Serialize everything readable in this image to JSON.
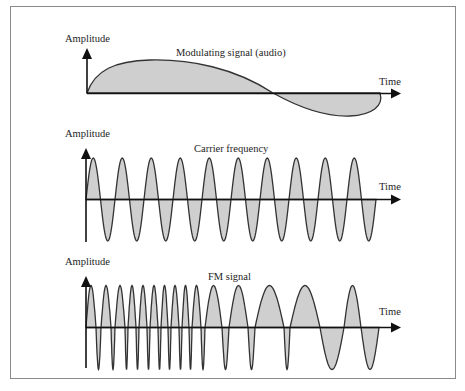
{
  "colors": {
    "frame_border": "#8a8a8a",
    "wave_fill": "#cfcfcf",
    "wave_stroke": "#333333",
    "axis": "#111111",
    "text": "#1e1e1e"
  },
  "panels": [
    {
      "id": "modulating",
      "y_label": "Amplitude",
      "x_label": "Time",
      "title": "Modulating signal (audio)"
    },
    {
      "id": "carrier",
      "y_label": "Amplitude",
      "x_label": "Time",
      "title": "Carrier frequency",
      "cycles": 10
    },
    {
      "id": "fm",
      "y_label": "Amplitude",
      "x_label": "Time",
      "title": "FM signal"
    }
  ]
}
